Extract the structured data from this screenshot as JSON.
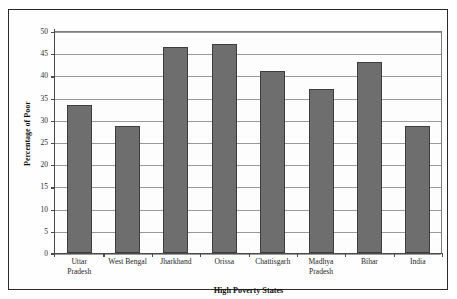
{
  "page": {
    "top_cropped_text": "."
  },
  "chart_data": {
    "type": "bar",
    "title": "",
    "xlabel": "High Poverty States",
    "ylabel": "Percentage of Poor",
    "categories": [
      "Uttar Pradesh",
      "West Bengal",
      "Jharkhand",
      "Orissa",
      "Chattisgarh",
      "Madhya Pradesh",
      "Bihar",
      "India"
    ],
    "category_lines": [
      [
        "Uttar",
        "Pradesh"
      ],
      [
        "West Bengal"
      ],
      [
        "Jharkhand"
      ],
      [
        "Orissa"
      ],
      [
        "Chattisgarh"
      ],
      [
        "Madhya",
        "Pradesh"
      ],
      [
        "Bihar"
      ],
      [
        "India"
      ]
    ],
    "values": [
      33.4,
      28.5,
      46.3,
      47.1,
      41.0,
      37.0,
      43.0,
      28.6
    ],
    "ylim": [
      0,
      50
    ],
    "ytick_step": 5,
    "ytick_labels": [
      "50",
      "45",
      "40",
      "35",
      "30",
      "25",
      "20",
      "15",
      "10",
      "5",
      "0"
    ],
    "grid": true,
    "legend": "none",
    "bar_color": "#6e6e6e",
    "bar_border_color": "#3d3d3d",
    "gridline_color": "#9a9a9a",
    "axis_color": "#4a4a4a",
    "frame_color": "#2a2a2a"
  }
}
